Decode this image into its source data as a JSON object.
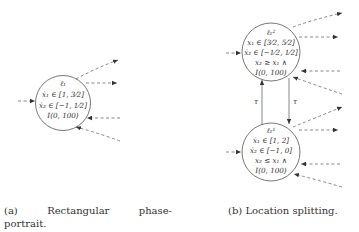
{
  "figure_a": {
    "node": {
      "label": "ℓ₁",
      "lines": [
        "ẋ₁ ∈ [1, 3⁄2]",
        "ẋ₂ ∈ [−1, 1⁄2]",
        "I(0, 100)"
      ]
    },
    "caption": {
      "tag": "(a)",
      "word1": "Rectangular",
      "word2": "phase-",
      "line2": "portrait."
    }
  },
  "figure_b": {
    "top_node": {
      "label": "ℓ₁²",
      "lines": [
        "x₁ ∈ [3⁄2, 5⁄2]",
        "ẋ₂ ∈ [−1⁄2, 1⁄2]",
        "x₂ ≥ x₁ ∧",
        "I(0, 100)"
      ]
    },
    "bottom_node": {
      "label": "ℓ₁¹",
      "lines": [
        "ẋ₁ ∈ [1, 2]",
        "ẋ₂ ∈ [−1, 0]",
        "x₂ ≤ x₁ ∧",
        "I(0, 100)"
      ]
    },
    "transition_labels": [
      "τ",
      "τ"
    ],
    "caption": "(b) Location splitting."
  },
  "colors": {
    "stroke": "#555555",
    "text": "#333333",
    "background": "#ffffff"
  }
}
